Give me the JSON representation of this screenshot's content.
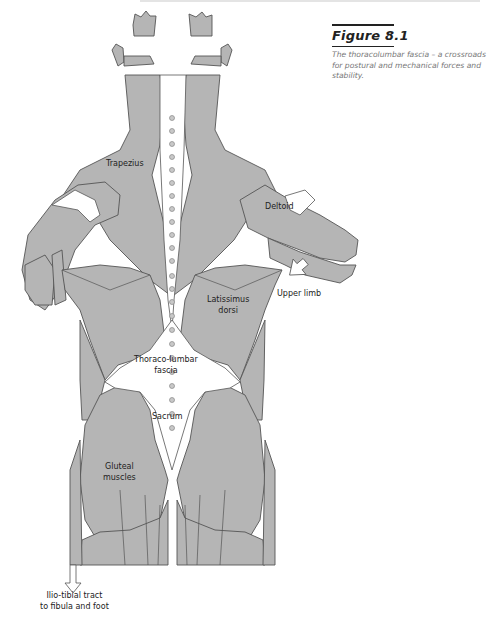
{
  "figure": {
    "number": "Figure 8.1",
    "caption": "The thoracolumbar fascia – a crossroads for postural and mechanical forces and stability."
  },
  "labels": {
    "trapezius": "Trapezius",
    "deltoid": "Deltoid",
    "upper_limb": "Upper limb",
    "latissimus_1": "Latissimus",
    "latissimus_2": "dorsi",
    "thoracolumbar_1": "Thoraco-lumbar",
    "thoracolumbar_2": "fascia",
    "sacrum": "Sacrum",
    "gluteal_1": "Gluteal",
    "gluteal_2": "muscles",
    "iliotibial_1": "Ilio-tibial tract",
    "iliotibial_2": "to fibula and foot"
  },
  "colors": {
    "muscle": "#b5b5b5",
    "outline": "#555555",
    "fascia": "#ffffff",
    "text": "#222222",
    "caption_text": "#777777"
  }
}
